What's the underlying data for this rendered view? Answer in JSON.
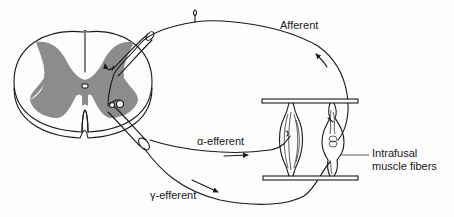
{
  "diagram": {
    "title": "",
    "labels": {
      "afferent": "Afferent",
      "alpha_efferent": "α-efferent",
      "gamma_efferent": "γ-efferent",
      "intrafusal_line1": "Intrafusal",
      "intrafusal_line2": "muscle fibers"
    },
    "components": [
      "spinal-cord-cross-section",
      "gray-matter",
      "central-canal",
      "dorsal-root",
      "ventral-root",
      "afferent-nerve-fiber",
      "alpha-efferent-fiber",
      "gamma-efferent-fiber",
      "extrafusal-muscle-fiber",
      "intrafusal-muscle-fiber",
      "muscle-tendon-plates"
    ],
    "colors": {
      "line": "#1a1a1a",
      "gray_matter": "#8c8c8c",
      "background": "#fdfdfd"
    }
  }
}
